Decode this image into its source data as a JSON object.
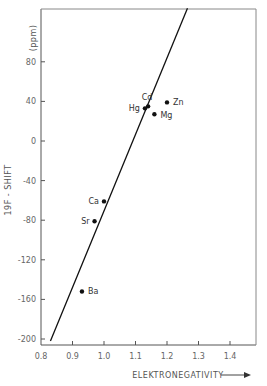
{
  "chart_data": {
    "type": "scatter",
    "title": "",
    "xlabel": "ELEKTRONEGATIVITY",
    "ylabel": "19F - SHIFT",
    "yunit": "(ppm)",
    "xlim": [
      0.8,
      1.47
    ],
    "ylim": [
      -213,
      135
    ],
    "grid": false,
    "xticks": [
      "0.8",
      "0.9",
      "1.0",
      "1.1",
      "1.2",
      "1.3",
      "1.4"
    ],
    "yticks": [
      "80",
      "40",
      "0",
      "-40",
      "-80",
      "-120",
      "-160",
      "-200"
    ],
    "points": [
      {
        "label": "Zn",
        "x": 1.2,
        "y": 39
      },
      {
        "label": "Cd",
        "x": 1.14,
        "y": 35
      },
      {
        "label": "Hg",
        "x": 1.13,
        "y": 33
      },
      {
        "label": "Mg",
        "x": 1.16,
        "y": 27
      },
      {
        "label": "Ca",
        "x": 1.0,
        "y": -61
      },
      {
        "label": "Sr",
        "x": 0.97,
        "y": -81
      },
      {
        "label": "Ba",
        "x": 0.93,
        "y": -152
      }
    ],
    "fit_line": {
      "x1": 0.83,
      "y1": -202,
      "x2": 1.265,
      "y2": 134
    }
  }
}
